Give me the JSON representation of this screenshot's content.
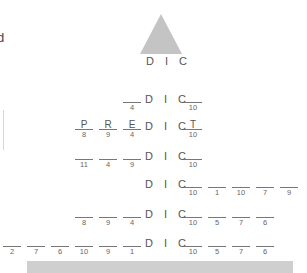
{
  "edge": {
    "partial_letter": "d"
  },
  "tree": {
    "apex_color": "#c4c4c4",
    "root_label": "D I C"
  },
  "rows": [
    {
      "top": 91,
      "prefix": [
        {
          "letter": "",
          "num": "4"
        }
      ],
      "core": "D I C",
      "suffix": [
        {
          "letter": "",
          "num": "10"
        }
      ]
    },
    {
      "top": 118,
      "prefix": [
        {
          "letter": "P",
          "num": "8"
        },
        {
          "letter": "R",
          "num": "9"
        },
        {
          "letter": "E",
          "num": "4"
        }
      ],
      "core": "D I C",
      "suffix": [
        {
          "letter": "T",
          "num": "10"
        }
      ]
    },
    {
      "top": 148,
      "prefix": [
        {
          "letter": "",
          "num": "11"
        },
        {
          "letter": "",
          "num": "4"
        },
        {
          "letter": "",
          "num": "9"
        }
      ],
      "core": "D I C",
      "suffix": [
        {
          "letter": "",
          "num": "10"
        }
      ]
    },
    {
      "top": 176,
      "prefix": [],
      "core": "D I C",
      "suffix": [
        {
          "letter": "",
          "num": "10"
        },
        {
          "letter": "",
          "num": "1"
        },
        {
          "letter": "",
          "num": "10"
        },
        {
          "letter": "",
          "num": "7"
        },
        {
          "letter": "",
          "num": "9"
        }
      ]
    },
    {
      "top": 206,
      "prefix": [
        {
          "letter": "",
          "num": "8"
        },
        {
          "letter": "",
          "num": "9"
        },
        {
          "letter": "",
          "num": "4"
        }
      ],
      "core": "D I C",
      "suffix": [
        {
          "letter": "",
          "num": "10"
        },
        {
          "letter": "",
          "num": "5"
        },
        {
          "letter": "",
          "num": "7"
        },
        {
          "letter": "",
          "num": "6"
        }
      ]
    },
    {
      "top": 235,
      "prefix": [
        {
          "letter": "",
          "num": "2"
        },
        {
          "letter": "",
          "num": "7"
        },
        {
          "letter": "",
          "num": "6"
        },
        {
          "letter": "",
          "num": "10"
        },
        {
          "letter": "",
          "num": "9"
        },
        {
          "letter": "",
          "num": "1"
        }
      ],
      "core": "D I C",
      "suffix": [
        {
          "letter": "",
          "num": "10"
        },
        {
          "letter": "",
          "num": "5"
        },
        {
          "letter": "",
          "num": "7"
        },
        {
          "letter": "",
          "num": "6"
        }
      ]
    }
  ],
  "bottom_bar": {
    "color": "#cfcfcf"
  }
}
